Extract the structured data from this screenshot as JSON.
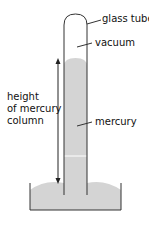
{
  "labels": {
    "glass_tube": "glass tube",
    "vacuum": "vacuum",
    "mercury": "mercury",
    "height_line1": "height",
    "height_line2": "of mercury",
    "height_line3": "column"
  },
  "colors": {
    "mercury": "#d4d4d4",
    "outline": "#333333"
  }
}
